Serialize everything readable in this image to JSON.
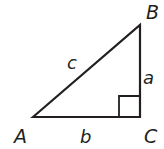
{
  "diagram": {
    "type": "right-triangle",
    "stroke_color": "#231f20",
    "background": "#ffffff",
    "vertices": {
      "A": {
        "label": "A",
        "x": 33,
        "y": 117
      },
      "B": {
        "label": "B",
        "x": 140,
        "y": 25
      },
      "C": {
        "label": "C",
        "x": 140,
        "y": 117
      }
    },
    "sides": {
      "a": {
        "label": "a",
        "between": "B-C"
      },
      "b": {
        "label": "b",
        "between": "A-C"
      },
      "c": {
        "label": "c",
        "between": "A-B"
      }
    },
    "right_angle_at": "C"
  }
}
